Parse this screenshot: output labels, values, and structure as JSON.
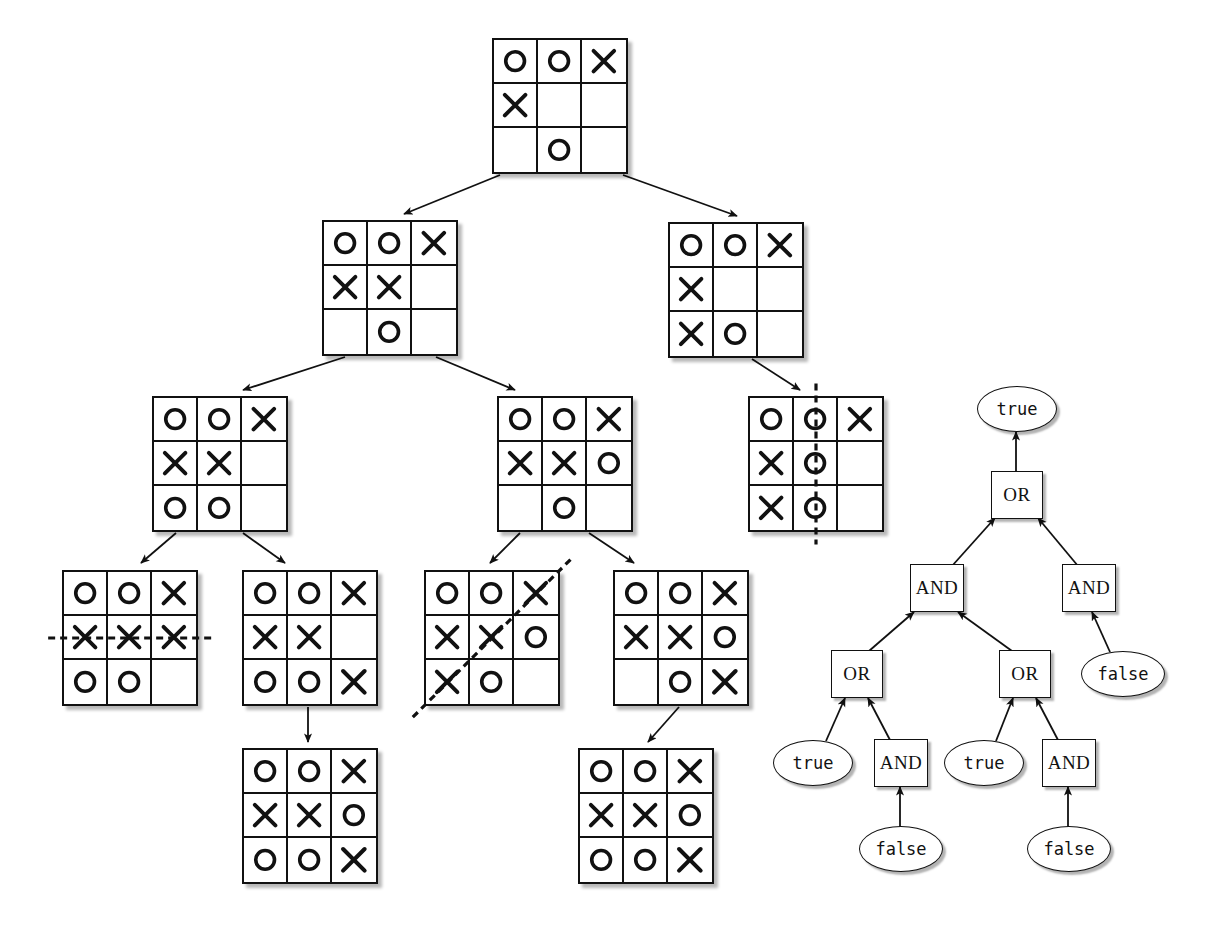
{
  "figure": {
    "background_color": "#ffffff",
    "ink_color": "#111111"
  },
  "game_tree": {
    "name": "tic-tac-toe-game-tree",
    "symbols": {
      "x": "X",
      "o": "O",
      "empty": ""
    },
    "nodes": [
      {
        "id": "root",
        "label": "root-board",
        "x": 492,
        "y": 38,
        "size": 132,
        "cells": [
          "O",
          "O",
          "X",
          "X",
          "",
          "",
          "",
          "O",
          ""
        ],
        "win_line": null
      },
      {
        "id": "L1",
        "label": "level1-left-board",
        "x": 322,
        "y": 220,
        "size": 132,
        "cells": [
          "O",
          "O",
          "X",
          "X",
          "X",
          "",
          "",
          "O",
          ""
        ],
        "win_line": null
      },
      {
        "id": "R1",
        "label": "level1-right-board",
        "x": 668,
        "y": 222,
        "size": 132,
        "cells": [
          "O",
          "O",
          "X",
          "X",
          "",
          "",
          "X",
          "O",
          ""
        ],
        "win_line": null
      },
      {
        "id": "L2",
        "label": "level2-left-board",
        "x": 152,
        "y": 396,
        "size": 132,
        "cells": [
          "O",
          "O",
          "X",
          "X",
          "X",
          "",
          "O",
          "O",
          ""
        ],
        "win_line": null
      },
      {
        "id": "M2",
        "label": "level2-middle-board",
        "x": 497,
        "y": 396,
        "size": 132,
        "cells": [
          "O",
          "O",
          "X",
          "X",
          "X",
          "O",
          "",
          "O",
          ""
        ],
        "win_line": null
      },
      {
        "id": "R2",
        "label": "level2-right-win-board",
        "x": 748,
        "y": 396,
        "size": 132,
        "cells": [
          "O",
          "O",
          "X",
          "X",
          "O",
          "",
          "X",
          "O",
          ""
        ],
        "win_line": "vertical-middle"
      },
      {
        "id": "L3a",
        "label": "level3-board-1-x-wins",
        "x": 62,
        "y": 570,
        "size": 132,
        "cells": [
          "O",
          "O",
          "X",
          "X",
          "X",
          "X",
          "O",
          "O",
          ""
        ],
        "win_line": "horizontal-middle"
      },
      {
        "id": "L3b",
        "label": "level3-board-2",
        "x": 242,
        "y": 570,
        "size": 132,
        "cells": [
          "O",
          "O",
          "X",
          "X",
          "X",
          "",
          "O",
          "O",
          "X"
        ],
        "win_line": null
      },
      {
        "id": "L3c",
        "label": "level3-board-3-x-wins",
        "x": 424,
        "y": 570,
        "size": 132,
        "cells": [
          "O",
          "O",
          "X",
          "X",
          "X",
          "O",
          "X",
          "O",
          ""
        ],
        "win_line": "anti-diagonal"
      },
      {
        "id": "L3d",
        "label": "level3-board-4",
        "x": 613,
        "y": 570,
        "size": 132,
        "cells": [
          "O",
          "O",
          "X",
          "X",
          "X",
          "O",
          "",
          "O",
          "X"
        ],
        "win_line": null
      },
      {
        "id": "L4a",
        "label": "level4-board-1-draw",
        "x": 242,
        "y": 748,
        "size": 132,
        "cells": [
          "O",
          "O",
          "X",
          "X",
          "X",
          "O",
          "O",
          "O",
          "X"
        ],
        "win_line": null
      },
      {
        "id": "L4b",
        "label": "level4-board-2-draw",
        "x": 578,
        "y": 748,
        "size": 132,
        "cells": [
          "O",
          "O",
          "X",
          "X",
          "X",
          "O",
          "O",
          "O",
          "X"
        ],
        "win_line": null
      }
    ],
    "edges": [
      {
        "from": "root",
        "to": "L1",
        "x1": 500,
        "y1": 175,
        "x2": 404,
        "y2": 214
      },
      {
        "from": "root",
        "to": "R1",
        "x1": 623,
        "y1": 175,
        "x2": 737,
        "y2": 216
      },
      {
        "from": "L1",
        "to": "L2",
        "x1": 345,
        "y1": 357,
        "x2": 243,
        "y2": 390
      },
      {
        "from": "L1",
        "to": "M2",
        "x1": 436,
        "y1": 357,
        "x2": 515,
        "y2": 390
      },
      {
        "from": "R1",
        "to": "R2",
        "x1": 752,
        "y1": 359,
        "x2": 800,
        "y2": 390
      },
      {
        "from": "L2",
        "to": "L3a",
        "x1": 176,
        "y1": 533,
        "x2": 141,
        "y2": 563
      },
      {
        "from": "L2",
        "to": "L3b",
        "x1": 243,
        "y1": 533,
        "x2": 285,
        "y2": 563
      },
      {
        "from": "M2",
        "to": "L3c",
        "x1": 520,
        "y1": 533,
        "x2": 490,
        "y2": 563
      },
      {
        "from": "M2",
        "to": "L3d",
        "x1": 589,
        "y1": 533,
        "x2": 634,
        "y2": 563
      },
      {
        "from": "L3b",
        "to": "L4a",
        "x1": 308,
        "y1": 707,
        "x2": 308,
        "y2": 742
      },
      {
        "from": "L3d",
        "to": "L4b",
        "x1": 679,
        "y1": 707,
        "x2": 648,
        "y2": 742
      }
    ]
  },
  "boolean_tree": {
    "name": "boolean-and-or-tree",
    "labels": {
      "and": "AND",
      "or": "OR",
      "true": "true",
      "false": "false"
    },
    "nodes": [
      {
        "id": "b-true-root",
        "kind": "leaf",
        "text": "true",
        "cx": 1016,
        "cy": 408,
        "w": 78,
        "h": 44
      },
      {
        "id": "b-or-root",
        "kind": "op",
        "text": "OR",
        "cx": 1016,
        "cy": 494,
        "w": 50,
        "h": 46
      },
      {
        "id": "b-and-left",
        "kind": "op",
        "text": "AND",
        "cx": 936,
        "cy": 587,
        "w": 52,
        "h": 46
      },
      {
        "id": "b-and-right",
        "kind": "op",
        "text": "AND",
        "cx": 1088,
        "cy": 587,
        "w": 52,
        "h": 46
      },
      {
        "id": "b-or-l",
        "kind": "op",
        "text": "OR",
        "cx": 856,
        "cy": 673,
        "w": 50,
        "h": 46
      },
      {
        "id": "b-or-r",
        "kind": "op",
        "text": "OR",
        "cx": 1024,
        "cy": 673,
        "w": 50,
        "h": 46
      },
      {
        "id": "b-false-r",
        "kind": "leaf",
        "text": "false",
        "cx": 1122,
        "cy": 673,
        "w": 82,
        "h": 44
      },
      {
        "id": "b-true-l",
        "kind": "leaf",
        "text": "true",
        "cx": 812,
        "cy": 762,
        "w": 78,
        "h": 44
      },
      {
        "id": "b-and-l2",
        "kind": "op",
        "text": "AND",
        "cx": 900,
        "cy": 762,
        "w": 52,
        "h": 46
      },
      {
        "id": "b-true-r",
        "kind": "leaf",
        "text": "true",
        "cx": 983,
        "cy": 762,
        "w": 78,
        "h": 44
      },
      {
        "id": "b-and-r2",
        "kind": "op",
        "text": "AND",
        "cx": 1068,
        "cy": 762,
        "w": 52,
        "h": 46
      },
      {
        "id": "b-false-l2",
        "kind": "leaf",
        "text": "false",
        "cx": 900,
        "cy": 848,
        "w": 82,
        "h": 44
      },
      {
        "id": "b-false-r2",
        "kind": "leaf",
        "text": "false",
        "cx": 1068,
        "cy": 848,
        "w": 82,
        "h": 44
      }
    ],
    "edges": [
      {
        "from": "b-or-root",
        "to": "b-true-root",
        "x1": 1016,
        "y1": 471,
        "x2": 1016,
        "y2": 432
      },
      {
        "from": "b-and-left",
        "to": "b-or-root",
        "x1": 952,
        "y1": 566,
        "x2": 995,
        "y2": 518
      },
      {
        "from": "b-and-right",
        "to": "b-or-root",
        "x1": 1078,
        "y1": 566,
        "x2": 1038,
        "y2": 518
      },
      {
        "from": "b-or-l",
        "to": "b-and-left",
        "x1": 869,
        "y1": 651,
        "x2": 914,
        "y2": 612
      },
      {
        "from": "b-or-r",
        "to": "b-and-left",
        "x1": 1012,
        "y1": 651,
        "x2": 958,
        "y2": 612
      },
      {
        "from": "b-false-r",
        "to": "b-and-right",
        "x1": 1110,
        "y1": 652,
        "x2": 1092,
        "y2": 612
      },
      {
        "from": "b-true-l",
        "to": "b-or-l",
        "x1": 826,
        "y1": 741,
        "x2": 845,
        "y2": 698
      },
      {
        "from": "b-and-l2",
        "to": "b-or-l",
        "x1": 890,
        "y1": 740,
        "x2": 868,
        "y2": 698
      },
      {
        "from": "b-true-r",
        "to": "b-or-r",
        "x1": 996,
        "y1": 741,
        "x2": 1013,
        "y2": 698
      },
      {
        "from": "b-and-r2",
        "to": "b-or-r",
        "x1": 1058,
        "y1": 740,
        "x2": 1036,
        "y2": 698
      },
      {
        "from": "b-false-l2",
        "to": "b-and-l2",
        "x1": 900,
        "y1": 827,
        "x2": 900,
        "y2": 787
      },
      {
        "from": "b-false-r2",
        "to": "b-and-r2",
        "x1": 1068,
        "y1": 827,
        "x2": 1068,
        "y2": 787
      }
    ]
  }
}
